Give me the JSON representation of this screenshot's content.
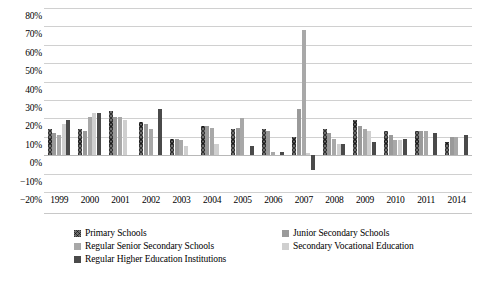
{
  "chart_data": {
    "type": "bar",
    "title": "",
    "subtitle": "",
    "xlabel": "",
    "ylabel": "",
    "ylim": [
      -20,
      80
    ],
    "ytick_step": 10,
    "grid": true,
    "legend_position": "bottom",
    "categories": [
      "1999",
      "2000",
      "2001",
      "2002",
      "2003",
      "2004",
      "2005",
      "2006",
      "2007",
      "2008",
      "2009",
      "2010",
      "2011",
      "2014"
    ],
    "ytick_labels": [
      "80%",
      "70%",
      "60%",
      "50%",
      "40%",
      "30%",
      "20%",
      "10%",
      "0%",
      "−10%",
      "−20%"
    ],
    "ytick_values": [
      80,
      70,
      60,
      50,
      40,
      30,
      20,
      10,
      0,
      -10,
      -20
    ],
    "series": [
      {
        "name": "Primary Schools",
        "color": "#6e6e6e",
        "pattern": "crosshatch",
        "values": [
          14,
          14,
          24,
          18,
          9,
          16,
          14,
          14,
          10,
          14,
          19,
          13,
          13,
          7
        ]
      },
      {
        "name": "Junior Secondary Schools",
        "color": "#9a9a9a",
        "pattern": "solid",
        "values": [
          12,
          13,
          21,
          17,
          9,
          16,
          15,
          13,
          25,
          12,
          16,
          11,
          13,
          10
        ]
      },
      {
        "name": "Regular Senior Secondary Schools",
        "color": "#a8a8a8",
        "pattern": "solid",
        "values": [
          11,
          21,
          21,
          14,
          8,
          15,
          20,
          2,
          68,
          9,
          14,
          8,
          13,
          10
        ]
      },
      {
        "name": "Secondary Vocational Education",
        "color": "#cfcfcf",
        "pattern": "solid",
        "values": [
          17,
          23,
          19,
          0,
          5,
          6,
          0,
          0,
          1,
          6,
          13,
          8,
          0,
          0
        ]
      },
      {
        "name": "Regular Higher Education Institutions",
        "color": "#4a4a4a",
        "pattern": "solid",
        "values": [
          19,
          23,
          0,
          25,
          0,
          0,
          5,
          2,
          -8,
          6,
          7,
          9,
          12,
          11
        ]
      }
    ]
  },
  "legend": {
    "items": [
      {
        "label": "Primary Schools",
        "series": 0
      },
      {
        "label": "Junior Secondary Schools",
        "series": 1
      },
      {
        "label": "Regular Senior Secondary Schools",
        "series": 2
      },
      {
        "label": "Secondary Vocational Education",
        "series": 3
      },
      {
        "label": "Regular Higher Education Institutions",
        "series": 4
      }
    ]
  }
}
